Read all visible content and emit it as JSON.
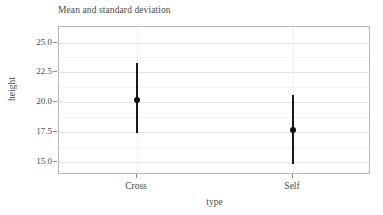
{
  "chart_data": {
    "type": "scatter",
    "title": "Mean and standard deviation",
    "xlabel": "type",
    "ylabel": "height",
    "categories": [
      "Cross",
      "Self"
    ],
    "series": [
      {
        "name": "mean",
        "values": [
          20.2,
          17.7
        ]
      },
      {
        "name": "lower",
        "values": [
          17.4,
          14.8
        ]
      },
      {
        "name": "upper",
        "values": [
          23.3,
          20.6
        ]
      }
    ],
    "points": [
      {
        "category": "Cross",
        "mean": 20.2,
        "lower": 17.4,
        "upper": 23.3
      },
      {
        "category": "Self",
        "mean": 17.7,
        "lower": 14.8,
        "upper": 20.6
      }
    ],
    "ylim": [
      13.9,
      26.3
    ],
    "yticks": [
      25.0,
      22.5,
      20.0,
      17.5,
      15.0
    ],
    "ytick_labels": [
      "25.0",
      "22.5",
      "20.0",
      "17.5",
      "15.0"
    ],
    "yminor": [
      23.75,
      21.25,
      18.75,
      16.25
    ],
    "xtick_labels": [
      "Cross",
      "Self"
    ],
    "grid": true,
    "legend": "none",
    "marker_color": "#111111",
    "errorbar_color": "#1a1a1a",
    "panel_border_color": "#b9b9b9",
    "gridline_color": "#e4e4e4"
  },
  "axis": {
    "y_title": "height",
    "x_title": "type"
  }
}
